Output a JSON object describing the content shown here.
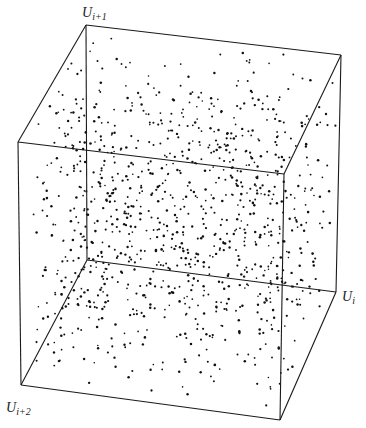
{
  "chart_data": {
    "type": "scatter",
    "subtype": "3d-scatter-cube",
    "title": "",
    "axes": {
      "x": {
        "label": "U_i",
        "base": "U",
        "sub": "i",
        "range": [
          0,
          1
        ]
      },
      "y": {
        "label": "U_{i+1}",
        "base": "U",
        "sub": "i+1",
        "range": [
          0,
          1
        ]
      },
      "z": {
        "label": "U_{i+2}",
        "base": "U",
        "sub": "i+2",
        "range": [
          0,
          1
        ]
      }
    },
    "grid": false,
    "legend": null,
    "num_planes": 15,
    "points_per_plane": 70,
    "band_direction": "lower-left to upper-right",
    "projected_vertices": {
      "top_back_left": [
        86,
        25
      ],
      "top_back_right": [
        341,
        55
      ],
      "top_front_left": [
        18,
        142
      ],
      "top_front_right": [
        284,
        174
      ],
      "bottom_back_left": [
        87,
        260
      ],
      "bottom_back_right": [
        336,
        292
      ],
      "bottom_front_left": [
        21,
        385
      ],
      "bottom_front_right": [
        280,
        420
      ]
    },
    "colors": {
      "points": "#111111",
      "edges": "#1a1a1a",
      "background": "#ffffff"
    }
  },
  "labels": {
    "u_i1": {
      "base": "U",
      "sub": "i+1"
    },
    "u_i": {
      "base": "U",
      "sub": "i"
    },
    "u_i2": {
      "base": "U",
      "sub": "i+2"
    }
  }
}
